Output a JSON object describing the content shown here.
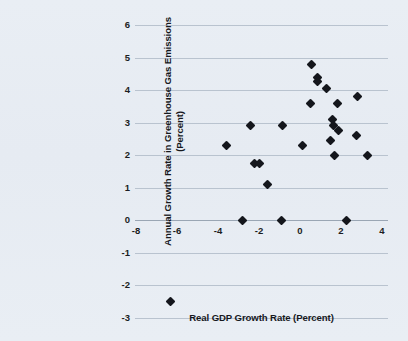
{
  "chart_data": {
    "type": "scatter",
    "title": "",
    "xlabel": "Real GDP Growth Rate (Percent)",
    "ylabel": "Annual Growth Rate in Greenhouse Gas Emissions (Percent)",
    "xlim": [
      -8,
      4
    ],
    "ylim": [
      -3,
      6
    ],
    "xticks": [
      -8,
      -6,
      -4,
      -2,
      0,
      2,
      4
    ],
    "yticks": [
      6,
      5,
      4,
      3,
      2,
      1,
      0,
      -1,
      -2,
      -3
    ],
    "xtick_labels": [
      "-8",
      "-6",
      "-4",
      "-2",
      "0",
      "2",
      "4"
    ],
    "ytick_labels": [
      "6",
      "5",
      "4",
      "3",
      "2",
      "1",
      "0",
      "-1",
      "-2",
      "-3"
    ],
    "grid": true,
    "grid_axis": "y",
    "legend": null,
    "marker": "diamond",
    "marker_color": "#14161c",
    "points": [
      {
        "x": -6.3,
        "y": -2.5
      },
      {
        "x": -3.6,
        "y": 2.3
      },
      {
        "x": -2.8,
        "y": 0.0
      },
      {
        "x": -2.4,
        "y": 2.9
      },
      {
        "x": -2.2,
        "y": 1.75
      },
      {
        "x": -2.0,
        "y": 1.75
      },
      {
        "x": -1.6,
        "y": 1.1
      },
      {
        "x": -0.9,
        "y": 0.0
      },
      {
        "x": -0.85,
        "y": 2.9
      },
      {
        "x": 0.1,
        "y": 2.3
      },
      {
        "x": 0.5,
        "y": 3.6
      },
      {
        "x": 0.55,
        "y": 4.8
      },
      {
        "x": 0.85,
        "y": 4.4
      },
      {
        "x": 0.85,
        "y": 4.25
      },
      {
        "x": 1.3,
        "y": 4.05
      },
      {
        "x": 1.5,
        "y": 2.45
      },
      {
        "x": 1.6,
        "y": 3.1
      },
      {
        "x": 1.65,
        "y": 2.9
      },
      {
        "x": 1.7,
        "y": 2.0
      },
      {
        "x": 1.85,
        "y": 3.6
      },
      {
        "x": 1.9,
        "y": 2.75
      },
      {
        "x": 2.25,
        "y": 0.0
      },
      {
        "x": 2.75,
        "y": 2.6
      },
      {
        "x": 2.8,
        "y": 3.8
      },
      {
        "x": 3.3,
        "y": 2.0
      }
    ]
  },
  "figure": {
    "background_color": "#e8edf3",
    "gridline_color": "#b9c3cf",
    "text_color": "#16181d"
  }
}
